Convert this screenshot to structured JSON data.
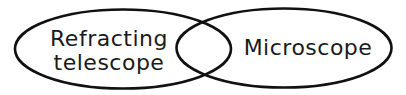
{
  "diagram": {
    "type": "venn",
    "stroke_color": "#111111",
    "background": "#ffffff",
    "sets": [
      {
        "id": "left",
        "lines": [
          "Refracting",
          "telescope"
        ]
      },
      {
        "id": "right",
        "lines": [
          "Microscope"
        ]
      }
    ],
    "intersection_label": ""
  }
}
